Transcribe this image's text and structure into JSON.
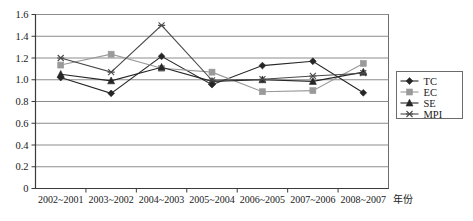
{
  "chart_data": {
    "type": "line",
    "title": "",
    "xlabel": "年份",
    "ylabel": "",
    "categories": [
      "2002~2001",
      "2003~2002",
      "2004~2003",
      "2005~2004",
      "2006~2005",
      "2007~2006",
      "2008~2007"
    ],
    "ylim": [
      0,
      1.6
    ],
    "ytick_labels": [
      "0",
      "0.2",
      "0.4",
      "0.6",
      "0.8",
      "1.0",
      "1.2",
      "1.4",
      "1.6"
    ],
    "ytick_values": [
      0,
      0.2,
      0.4,
      0.6,
      0.8,
      1.0,
      1.2,
      1.4,
      1.6
    ],
    "grid": "horizontal",
    "legend_position": "right",
    "series": [
      {
        "name": "TC",
        "marker": "diamond",
        "color": "#262626",
        "values": [
          1.02,
          0.875,
          1.215,
          0.955,
          1.13,
          1.17,
          0.88
        ]
      },
      {
        "name": "EC",
        "marker": "square",
        "color": "#9a9a9a",
        "values": [
          1.135,
          1.235,
          1.105,
          1.07,
          0.89,
          0.9,
          1.15
        ]
      },
      {
        "name": "SE",
        "marker": "triangle",
        "color": "#262626",
        "values": [
          1.05,
          0.99,
          1.115,
          0.985,
          1.0,
          0.985,
          1.07
        ]
      },
      {
        "name": "MPI",
        "marker": "x",
        "color": "#4a4a4a",
        "values": [
          1.2,
          1.07,
          1.5,
          0.995,
          1.005,
          1.035,
          1.06
        ]
      }
    ]
  },
  "colors": {
    "axis": "#3a3a3a",
    "grid": "#8c8c8c",
    "frame": "#6b6b6b",
    "text": "#1a1a1a",
    "background": "#ffffff"
  }
}
